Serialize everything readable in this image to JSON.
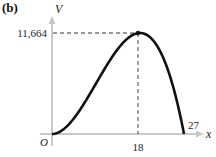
{
  "panel_label": "(b)",
  "chart_data": {
    "type": "line",
    "title": "",
    "xlabel": "x",
    "ylabel": "V",
    "function_description": "Curve rising from origin to a maximum then falling to zero",
    "x": [
      0,
      3,
      6,
      9,
      12,
      15,
      18,
      21,
      24,
      27
    ],
    "values": [
      0,
      864,
      3024,
      5832,
      8640,
      10800,
      11664,
      10584,
      6912,
      0
    ],
    "xlim": [
      0,
      27
    ],
    "ylim": [
      0,
      11664
    ],
    "x_ticks": [
      "18",
      "27"
    ],
    "y_ticks": [
      "11,664"
    ],
    "origin_label": "O",
    "annotations": [
      {
        "type": "max-point",
        "x": 18,
        "y": 11664,
        "dashed_guides": true
      }
    ],
    "grid": false,
    "legend": "none"
  },
  "labels": {
    "y_axis": "V",
    "x_axis": "x",
    "origin": "O",
    "y_max_tick": "11,664",
    "x_max_tick": "18",
    "x_root_tick": "27"
  },
  "colors": {
    "axis": "#c8c8c8",
    "curve": "#111111",
    "guide": "#333333"
  }
}
